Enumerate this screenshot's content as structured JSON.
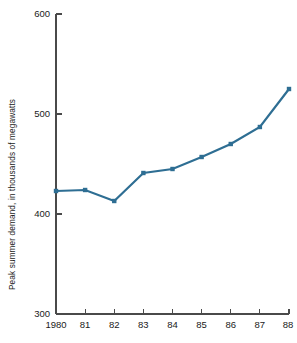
{
  "chart_data": {
    "type": "line",
    "title": "",
    "xlabel": "",
    "ylabel": "Peak summer demand, in thousands of megawatts",
    "categories": [
      "1980",
      "81",
      "82",
      "83",
      "84",
      "85",
      "86",
      "87",
      "88"
    ],
    "x_tick_labels": [
      "1980",
      "81",
      "82",
      "83",
      "84",
      "85",
      "86",
      "87",
      "88"
    ],
    "y_tick_labels": [
      "600",
      "500",
      "400",
      "300"
    ],
    "y_ticks": [
      600,
      500,
      400,
      300
    ],
    "ylim": [
      300,
      600
    ],
    "grid": false,
    "legend": false,
    "legend_position": "none",
    "series": [
      {
        "name": "Peak summer demand",
        "color": "#2e6e93",
        "marker": "square",
        "values": [
          423,
          424,
          413,
          441,
          445,
          457,
          470,
          487,
          525
        ]
      }
    ],
    "colors": {
      "line": "#2e6e93",
      "axis": "#4a4a4a",
      "text": "#1a1a1a",
      "background": "#ffffff"
    }
  }
}
